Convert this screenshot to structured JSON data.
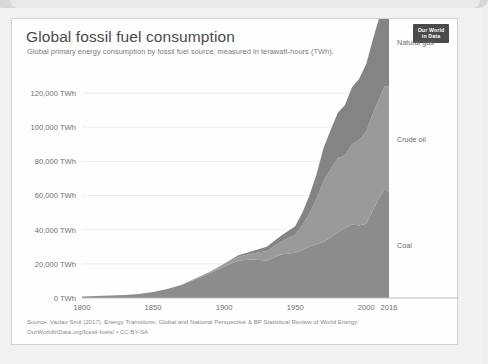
{
  "card": {
    "title": "Global fossil fuel consumption",
    "subtitle": "Global primary energy consumption by fossil fuel source, measured in terawatt-hours (TWh).",
    "logo_line1": "Our World",
    "logo_line2": "in Data",
    "source_line": "Source: Vaclav Smil (2017). Energy Transitions: Global and National Perspective & BP Statistical Review of World Energy",
    "license_line": "OurWorldInData.org/fossil-fuels/ • CC BY-SA"
  },
  "colors": {
    "coal": "#8c8c8c",
    "crude_oil": "#9a9a9a",
    "natural_gas": "#848484",
    "text": "#6f6f6f",
    "axis": "#bdbdbd",
    "grid": "#ededed",
    "card_bg": "#fefefe",
    "logo_bg": "#4a4a4a"
  },
  "chart_data": {
    "type": "area",
    "title": "Global fossil fuel consumption",
    "subtitle": "Global primary energy consumption by fossil fuel source, measured in terawatt-hours (TWh).",
    "stacked": true,
    "xlabel": "",
    "ylabel": "TWh",
    "xlim": [
      1800,
      2016
    ],
    "ylim": [
      0,
      140000
    ],
    "grid": true,
    "legend_position": "right-inline",
    "xticks": [
      1800,
      1850,
      1900,
      1950,
      2000,
      2016
    ],
    "xtick_labels": [
      "1800",
      "1850",
      "1900",
      "1950",
      "2000",
      "2016"
    ],
    "yticks": [
      0,
      20000,
      40000,
      60000,
      80000,
      100000,
      120000
    ],
    "ytick_labels": [
      "0 TWh",
      "20,000 TWh",
      "40,000 TWh",
      "60,000 TWh",
      "80,000 TWh",
      "100,000 TWh",
      "120,000 TWh"
    ],
    "x": [
      1800,
      1810,
      1820,
      1830,
      1840,
      1850,
      1860,
      1870,
      1880,
      1890,
      1900,
      1910,
      1920,
      1930,
      1940,
      1950,
      1955,
      1960,
      1965,
      1970,
      1975,
      1980,
      1985,
      1990,
      1995,
      2000,
      2005,
      2010,
      2013,
      2016
    ],
    "series": [
      {
        "name": "Coal",
        "color": "#8c8c8c",
        "values": [
          900,
          1100,
          1400,
          1800,
          2400,
          3500,
          5200,
          7600,
          11000,
          14500,
          18500,
          22000,
          22500,
          22000,
          25500,
          26500,
          28000,
          30000,
          31500,
          33000,
          35500,
          38500,
          41000,
          43000,
          42500,
          43500,
          52000,
          60000,
          64000,
          62000
        ]
      },
      {
        "name": "Crude oil",
        "color": "#9a9a9a",
        "values": [
          0,
          0,
          0,
          0,
          0,
          0,
          100,
          200,
          400,
          700,
          1200,
          2200,
          3500,
          5500,
          7500,
          10500,
          14500,
          19500,
          26500,
          35500,
          40000,
          43500,
          42500,
          47000,
          50000,
          54000,
          57000,
          58500,
          60000,
          62000
        ]
      },
      {
        "name": "Natural gas",
        "color": "#848484",
        "values": [
          0,
          0,
          0,
          0,
          0,
          0,
          0,
          0,
          100,
          200,
          400,
          800,
          1500,
          2500,
          3500,
          5000,
          7500,
          10500,
          14500,
          19500,
          23000,
          26500,
          29500,
          33500,
          36000,
          39500,
          43500,
          48000,
          50000,
          52000
        ]
      }
    ],
    "series_label_positions": [
      {
        "name": "Natural gas",
        "label": "Natural gas"
      },
      {
        "name": "Crude oil",
        "label": "Crude oil"
      },
      {
        "name": "Coal",
        "label": "Coal"
      }
    ],
    "peak_total_2016": 136000
  }
}
